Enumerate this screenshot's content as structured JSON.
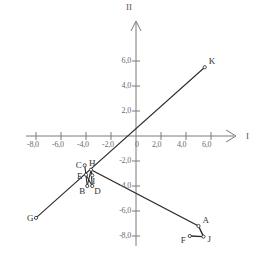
{
  "chart_data": {
    "type": "scatter",
    "title": "",
    "xlabel": "I",
    "ylabel": "II",
    "xlim": [
      -8.8,
      7.2
    ],
    "ylim": [
      -8.8,
      6.8
    ],
    "grid": false,
    "legend": "none",
    "x_ticks": [
      {
        "value": -8,
        "label": "-8,0"
      },
      {
        "value": -6,
        "label": "-6,0"
      },
      {
        "value": -4,
        "label": "-4,0"
      },
      {
        "value": -2,
        "label": "-2,0"
      },
      {
        "value": 0,
        "label": "0"
      },
      {
        "value": 2,
        "label": "2,0"
      },
      {
        "value": 4,
        "label": "4,0"
      },
      {
        "value": 6,
        "label": "6,0"
      }
    ],
    "y_ticks": [
      {
        "value": 6,
        "label": "6,0"
      },
      {
        "value": 4,
        "label": "4,0"
      },
      {
        "value": 2,
        "label": "2,0"
      },
      {
        "value": -2,
        "label": "-2,0"
      },
      {
        "value": -4,
        "label": "-4,0"
      },
      {
        "value": -6,
        "label": "-6,0"
      },
      {
        "value": -8,
        "label": "-8,0"
      }
    ],
    "points": [
      {
        "name": "A",
        "x": 5.0,
        "y": -7.2,
        "label_dx": 4,
        "label_dy": -11
      },
      {
        "name": "B",
        "x": -3.9,
        "y": -4.0,
        "label_dx": -8,
        "label_dy": 0
      },
      {
        "name": "C",
        "x": -4.1,
        "y": -2.35,
        "label_dx": -9,
        "label_dy": -5
      },
      {
        "name": "D",
        "x": -3.5,
        "y": -4.0,
        "label_dx": 2,
        "label_dy": 0
      },
      {
        "name": "E",
        "x": -4.0,
        "y": -3.1,
        "label_dx": -9,
        "label_dy": -4
      },
      {
        "name": "F",
        "x": 4.3,
        "y": -8.0,
        "label_dx": -9,
        "label_dy": -1
      },
      {
        "name": "G",
        "x": -8.0,
        "y": -6.55,
        "label_dx": -9,
        "label_dy": -5
      },
      {
        "name": "H",
        "x": -3.6,
        "y": -2.7,
        "label_dx": -2,
        "label_dy": -12
      },
      {
        "name": "I",
        "x": -3.5,
        "y": -3.15,
        "label_dx": 0,
        "label_dy": 1
      },
      {
        "name": "J",
        "x": 5.4,
        "y": -8.05,
        "label_dx": 4,
        "label_dy": -3
      },
      {
        "name": "K",
        "x": 5.5,
        "y": 5.5,
        "label_dx": 4,
        "label_dy": -11
      }
    ],
    "polylines": [
      {
        "name": "line-G-K",
        "points": [
          [
            -8.0,
            -6.55
          ],
          [
            5.5,
            5.5
          ]
        ]
      },
      {
        "name": "line-H-A-J-F",
        "points": [
          [
            -3.6,
            -2.7
          ],
          [
            5.0,
            -7.2
          ],
          [
            5.4,
            -8.05
          ],
          [
            4.3,
            -8.0
          ]
        ]
      },
      {
        "name": "line-C-B",
        "points": [
          [
            -4.1,
            -2.35
          ],
          [
            -3.9,
            -4.0
          ]
        ]
      },
      {
        "name": "line-B-H",
        "points": [
          [
            -3.9,
            -4.0
          ],
          [
            -3.6,
            -2.7
          ]
        ]
      },
      {
        "name": "line-E-D",
        "points": [
          [
            -4.0,
            -3.1
          ],
          [
            -3.5,
            -4.0
          ]
        ]
      },
      {
        "name": "line-D-H",
        "points": [
          [
            -3.5,
            -4.0
          ],
          [
            -3.6,
            -2.7
          ]
        ]
      },
      {
        "name": "line-H-I",
        "points": [
          [
            -3.6,
            -2.7
          ],
          [
            -3.5,
            -3.15
          ]
        ]
      }
    ]
  }
}
